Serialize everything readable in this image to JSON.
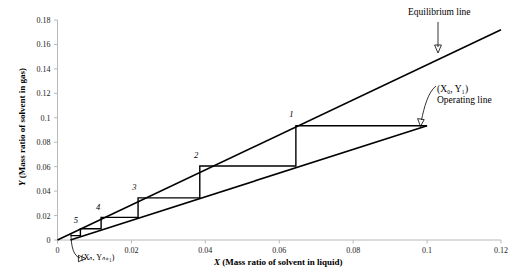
{
  "chart_data": {
    "type": "line",
    "title": "",
    "xlabel": "X (Mass ratio of solvent in liquid)",
    "ylabel": "Y (Mass ratio of solvent in gas)",
    "xlim": [
      0,
      0.12
    ],
    "ylim": [
      0,
      0.18
    ],
    "xticks": [
      "0",
      "0.02",
      "0.04",
      "0.06",
      "0.08",
      "0.1",
      "0.12"
    ],
    "xtick_values": [
      0,
      0.02,
      0.04,
      0.06,
      0.08,
      0.1,
      0.12
    ],
    "yticks": [
      "0",
      "0.02",
      "0.04",
      "0.06",
      "0.08",
      "0.1",
      "0.12",
      "0.14",
      "0.16",
      "0.18"
    ],
    "ytick_values": [
      0,
      0.02,
      0.04,
      0.06,
      0.08,
      0.1,
      0.12,
      0.14,
      0.16,
      0.18
    ],
    "grid": false,
    "legend": "none",
    "series": [
      {
        "name": "Equilibrium line",
        "x": [
          0,
          0.12
        ],
        "y": [
          0,
          0.172
        ]
      },
      {
        "name": "Operating line",
        "x": [
          0.0035,
          0.1
        ],
        "y": [
          0,
          0.0935
        ]
      }
    ],
    "staircase": {
      "name": "McCabe-Thiele stages",
      "points_x": [
        0.1,
        0.0645,
        0.0645,
        0.0385,
        0.0385,
        0.0218,
        0.0218,
        0.0118,
        0.0118,
        0.0062,
        0.0062,
        0.0035
      ],
      "points_y": [
        0.0935,
        0.0935,
        0.0605,
        0.0605,
        0.0345,
        0.0345,
        0.0185,
        0.0185,
        0.0092,
        0.0092,
        0.0036,
        0.0036
      ]
    },
    "stage_labels": [
      {
        "id": "1",
        "x": 0.0633,
        "y": 0.1005
      },
      {
        "id": "2",
        "x": 0.0375,
        "y": 0.0672
      },
      {
        "id": "3",
        "x": 0.0208,
        "y": 0.0408
      },
      {
        "id": "4",
        "x": 0.011,
        "y": 0.0243
      },
      {
        "id": "5",
        "x": 0.005,
        "y": 0.014
      }
    ],
    "annotations": {
      "equilibrium_line": "Equilibrium line",
      "operating_line": "Operating line",
      "top_coordinate": "(X₀, Y₁)",
      "bottom_coordinate": "(Xₙ, Yₙ₊₁)"
    },
    "colors": {
      "line": "#000000",
      "axis": "#b9b9b9",
      "text": "#000000",
      "background": "#ffffff"
    }
  },
  "axes": {
    "x_title_var": "X",
    "x_title_rest": "(Mass ratio of solvent in liquid)",
    "y_title_var": "Y",
    "y_title_rest": "(Mass ratio of solvent in gas)"
  }
}
